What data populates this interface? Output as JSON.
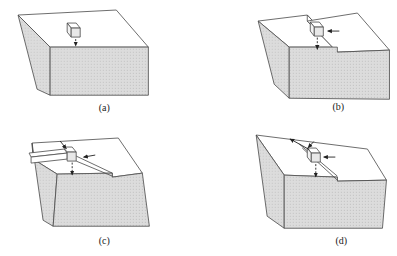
{
  "figure": {
    "panels": [
      {
        "id": "a",
        "label": "(a)"
      },
      {
        "id": "b",
        "label": "(b)"
      },
      {
        "id": "c",
        "label": "(c)"
      },
      {
        "id": "d",
        "label": "(d)"
      }
    ],
    "colors": {
      "background": "#ffffff",
      "shaded_face": "#dcdcdc",
      "stipple_dot": "#b8b8b8",
      "top_face": "#ffffff",
      "line": "#4a4a4a",
      "arrow": "#222222",
      "label_text": "#1a1a1a"
    }
  }
}
